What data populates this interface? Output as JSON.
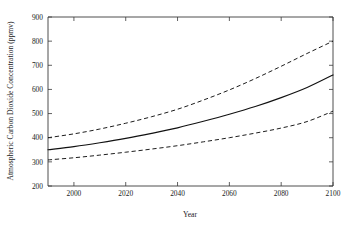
{
  "chart_data": {
    "type": "line",
    "title": "",
    "xlabel": "Year",
    "ylabel": "Atmospheric Carbon Dioxide Concentration (ppmv)",
    "xlim": [
      1990,
      2100
    ],
    "ylim": [
      200,
      900
    ],
    "xticks": [
      2000,
      2020,
      2040,
      2060,
      2080,
      2100
    ],
    "yticks": [
      200,
      300,
      400,
      500,
      600,
      700,
      800,
      900
    ],
    "xtick_labels": [
      "2000",
      "2020",
      "2040",
      "2060",
      "2080",
      "2100"
    ],
    "ytick_labels": [
      "200",
      "300",
      "400",
      "500",
      "600",
      "700",
      "800",
      "900"
    ],
    "grid": false,
    "legend": "none",
    "x": [
      1990,
      2000,
      2010,
      2020,
      2030,
      2040,
      2050,
      2060,
      2070,
      2080,
      2090,
      2100
    ],
    "series": [
      {
        "name": "upper-bound",
        "style": "dashed",
        "color": "#111111",
        "values": [
          400,
          416,
          436,
          460,
          487,
          518,
          556,
          598,
          645,
          696,
          749,
          800
        ]
      },
      {
        "name": "median",
        "style": "solid",
        "color": "#111111",
        "values": [
          350,
          363,
          379,
          397,
          418,
          441,
          468,
          497,
          529,
          566,
          608,
          660
        ]
      },
      {
        "name": "lower-bound",
        "style": "dashed",
        "color": "#111111",
        "values": [
          308,
          317,
          328,
          340,
          353,
          367,
          383,
          400,
          419,
          440,
          467,
          510
        ]
      }
    ]
  },
  "axes": {
    "x_title": "Year",
    "y_title": "Atmospheric Carbon Dioxide Concentration (ppmv)"
  },
  "colors": {
    "line": "#111111",
    "axis": "#3a3a3a",
    "background": "#ffffff"
  }
}
